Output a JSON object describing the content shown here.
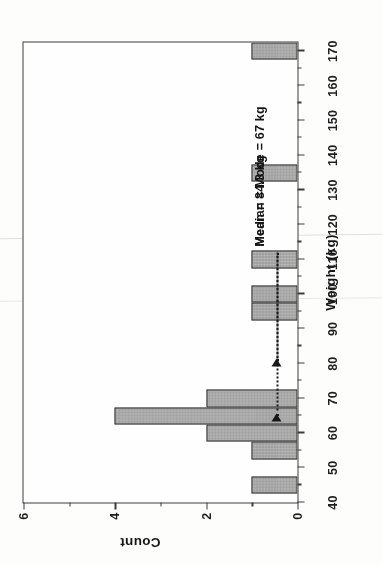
{
  "figure": {
    "orientation": "rotated-90-ccw",
    "page_background": "#fdfdfc",
    "bar_fill": "#a8a8a8",
    "bar_edge": "#2e2e2e",
    "ink_color": "#1c1c1c"
  },
  "chart_data": {
    "type": "bar",
    "title": "",
    "xlabel": "Weight (kg)",
    "ylabel": "Count",
    "xlim": [
      40,
      172.5
    ],
    "ylim": [
      0,
      6
    ],
    "xticks": [
      40,
      50,
      60,
      70,
      80,
      90,
      100,
      110,
      120,
      130,
      140,
      150,
      160,
      170
    ],
    "xtick_labels": [
      "40",
      "50",
      "60",
      "70",
      "80",
      "90",
      "100",
      "110",
      "120",
      "130",
      "140",
      "150",
      "160",
      "170"
    ],
    "xminor_ticks": [
      45,
      55,
      65,
      75,
      85,
      95,
      105,
      115,
      125,
      135,
      145,
      155,
      165
    ],
    "yticks": [
      0,
      2,
      4,
      6
    ],
    "ytick_labels": [
      "0",
      "2",
      "4",
      "6"
    ],
    "yminor_ticks": [
      1,
      3,
      5
    ],
    "grid": false,
    "legend": null,
    "bin_width": 5,
    "bins": [
      {
        "left": 42.5,
        "right": 47.5,
        "count": 1
      },
      {
        "left": 52.5,
        "right": 57.5,
        "count": 1
      },
      {
        "left": 57.5,
        "right": 62.5,
        "count": 2
      },
      {
        "left": 62.5,
        "right": 67.5,
        "count": 4
      },
      {
        "left": 67.5,
        "right": 72.5,
        "count": 2
      },
      {
        "left": 92.5,
        "right": 97.5,
        "count": 1
      },
      {
        "left": 97.5,
        "right": 102.5,
        "count": 1
      },
      {
        "left": 107.5,
        "right": 112.5,
        "count": 1
      },
      {
        "left": 132.5,
        "right": 137.5,
        "count": 1
      },
      {
        "left": 167.5,
        "right": 172.5,
        "count": 1
      }
    ],
    "categories": [
      "42.5-47.5",
      "52.5-57.5",
      "57.5-62.5",
      "62.5-67.5",
      "67.5-72.5",
      "92.5-97.5",
      "97.5-102.5",
      "107.5-112.5",
      "132.5-137.5",
      "167.5-172.5"
    ],
    "values": [
      1,
      1,
      2,
      4,
      2,
      1,
      1,
      1,
      1,
      1
    ],
    "annotations": [
      {
        "id": "median-mode",
        "text": "Median = Mode = 67 kg",
        "value": 67,
        "unit": "kg",
        "pointer_x": 65,
        "pointer_y": 0.45,
        "leader_from_x": 112,
        "style": "dotted-line-with-arrow"
      },
      {
        "id": "mean",
        "text": "Mean = 84.3 kg",
        "value": 84.3,
        "unit": "kg",
        "pointer_x": 81,
        "pointer_y": 0.45,
        "leader_from_x": 112,
        "style": "dotted-line-with-arrow"
      }
    ]
  }
}
